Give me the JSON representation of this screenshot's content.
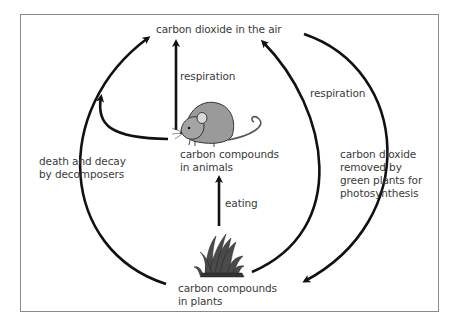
{
  "diagram": {
    "title": "",
    "nodes": {
      "air": {
        "label": "carbon dioxide in the air"
      },
      "animals": {
        "line1": "carbon compounds",
        "line2": "in animals"
      },
      "plants": {
        "line1": "carbon compounds",
        "line2": "in plants"
      }
    },
    "edges": {
      "animal_respiration": {
        "label": "respiration",
        "from": "animals",
        "to": "air"
      },
      "plant_respiration": {
        "label": "respiration",
        "from": "plants",
        "to": "air"
      },
      "eating": {
        "label": "eating",
        "from": "plants",
        "to": "animals"
      },
      "decay": {
        "line1": "death and decay",
        "line2": "by decomposers",
        "from": "plants",
        "to": "air"
      },
      "animal_decay": {
        "label": "",
        "from": "animals",
        "to": "air"
      },
      "photosynthesis": {
        "line1": "carbon dioxide",
        "line2": "removed by",
        "line3": "green plants for",
        "line4": "photosynthesis",
        "from": "air",
        "to": "plants"
      }
    },
    "icons": {
      "animal": "mouse-icon",
      "plant": "grass-icon"
    },
    "colors": {
      "arrow": "#111111",
      "text": "#3a3a3a",
      "frame": "#8a8a8a",
      "mouse_body": "#9a9a9a",
      "grass": "#444444"
    }
  }
}
